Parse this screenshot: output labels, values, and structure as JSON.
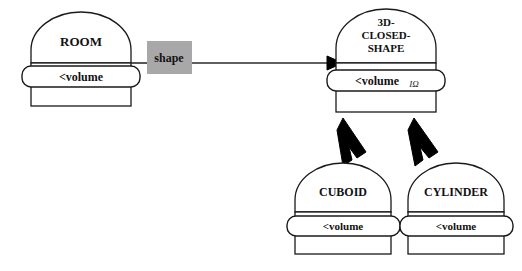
{
  "diagram": {
    "type": "class-diagram",
    "background_color": "#ffffff",
    "line_color": "#1a1a1a",
    "label_box_color": "#a8a8a8",
    "nodes": [
      {
        "id": "room",
        "name": "ROOM",
        "attribute": "<volume",
        "attribute_marker": "",
        "x": 29,
        "y": 13,
        "width": 104,
        "height": 93
      },
      {
        "id": "closed-shape",
        "name_lines": [
          "3D-",
          "CLOSED-",
          "SHAPE"
        ],
        "name": "3D-CLOSED-SHAPE",
        "attribute": "<volume",
        "attribute_marker": "IΩ",
        "x": 334,
        "y": 9,
        "width": 104,
        "height": 103
      },
      {
        "id": "cuboid",
        "name": "CUBOID",
        "attribute": "<volume",
        "attribute_marker": "",
        "x": 293,
        "y": 163,
        "width": 100,
        "height": 97
      },
      {
        "id": "cylinder",
        "name": "CYLINDER",
        "attribute": "<volume",
        "attribute_marker": "",
        "x": 406,
        "y": 163,
        "width": 100,
        "height": 97
      }
    ],
    "edges": [
      {
        "id": "room-shape-assoc",
        "kind": "association",
        "label": "shape",
        "from": "room",
        "to": "closed-shape",
        "arrow": "filled-triangle"
      },
      {
        "id": "cuboid-inherit",
        "kind": "inheritance",
        "from": "cuboid",
        "to": "closed-shape",
        "arrow": "solid-thick-arrow"
      },
      {
        "id": "cylinder-inherit",
        "kind": "inheritance",
        "from": "cylinder",
        "to": "closed-shape",
        "arrow": "solid-thick-arrow"
      }
    ]
  }
}
